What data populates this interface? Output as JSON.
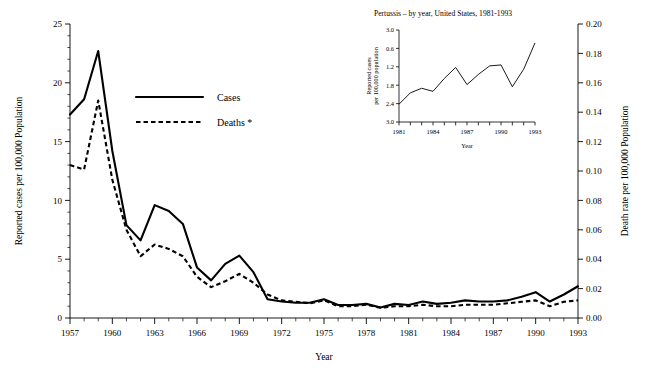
{
  "chart_data": [
    {
      "id": "main",
      "type": "line",
      "title": "",
      "xlabel": "Year",
      "ylabel": "Reported cases per 100,000 Population",
      "y2label": "Death rate per 100,000 Population",
      "xlim": [
        1957,
        1993
      ],
      "ylim": [
        0,
        25
      ],
      "y2lim": [
        0.0,
        0.2
      ],
      "grid": false,
      "legend_position": "upper-center-left",
      "xticks": [
        1957,
        1960,
        1963,
        1966,
        1969,
        1972,
        1975,
        1978,
        1981,
        1984,
        1987,
        1990,
        1993
      ],
      "xticklabels": [
        "1957",
        "1960",
        "1963",
        "1966",
        "1969",
        "1972",
        "1975",
        "1978",
        "1981",
        "1984",
        "1987",
        "1990",
        "1993"
      ],
      "yticks": [
        0,
        5,
        10,
        15,
        20,
        25
      ],
      "yticklabels": [
        "0",
        "5",
        "10",
        "15",
        "20",
        "25"
      ],
      "y2ticks": [
        0.0,
        0.02,
        0.04,
        0.06,
        0.08,
        0.1,
        0.12,
        0.14,
        0.16,
        0.18,
        0.2
      ],
      "y2ticklabels": [
        "0.00",
        "0.02",
        "0.04",
        "0.06",
        "0.08",
        "0.10",
        "0.12",
        "0.14",
        "0.16",
        "0.18",
        "0.20"
      ],
      "x": [
        1957,
        1958,
        1959,
        1960,
        1961,
        1962,
        1963,
        1964,
        1965,
        1966,
        1967,
        1968,
        1969,
        1970,
        1971,
        1972,
        1973,
        1974,
        1975,
        1976,
        1977,
        1978,
        1979,
        1980,
        1981,
        1982,
        1983,
        1984,
        1985,
        1986,
        1987,
        1988,
        1989,
        1990,
        1991,
        1992,
        1993
      ],
      "series": [
        {
          "name": "Cases",
          "axis": "left",
          "style": "solid",
          "values": [
            17.3,
            18.6,
            22.7,
            14.2,
            7.9,
            6.6,
            9.6,
            9.1,
            8.0,
            4.3,
            3.2,
            4.6,
            5.3,
            3.9,
            1.6,
            1.4,
            1.3,
            1.3,
            1.6,
            1.1,
            1.1,
            1.2,
            0.9,
            1.2,
            1.1,
            1.4,
            1.2,
            1.3,
            1.5,
            1.4,
            1.4,
            1.5,
            1.8,
            2.2,
            1.4,
            2.0,
            2.7
          ]
        },
        {
          "name": "Deaths *",
          "axis": "right",
          "style": "dashed",
          "values": [
            0.104,
            0.101,
            0.148,
            0.094,
            0.06,
            0.042,
            0.05,
            0.047,
            0.042,
            0.028,
            0.021,
            0.025,
            0.03,
            0.024,
            0.016,
            0.012,
            0.011,
            0.01,
            0.012,
            0.008,
            0.008,
            0.009,
            0.007,
            0.008,
            0.008,
            0.009,
            0.008,
            0.008,
            0.009,
            0.009,
            0.009,
            0.01,
            0.011,
            0.012,
            0.008,
            0.011,
            0.012
          ]
        }
      ]
    },
    {
      "id": "inset",
      "type": "line",
      "title": "Pertussis – by year, United States, 1981-1993",
      "xlabel": "Year",
      "ylabel_line1": "Reported cases",
      "ylabel_line2": "per 100,000 population",
      "xlim": [
        1981,
        1993
      ],
      "ylim": [
        0.0,
        3.0
      ],
      "grid": false,
      "xticks": [
        1981,
        1982,
        1983,
        1984,
        1985,
        1986,
        1987,
        1988,
        1989,
        1990,
        1991,
        1992,
        1993
      ],
      "xticklabels_shown": [
        "1981",
        "1984",
        "1987",
        "1990",
        "1993"
      ],
      "yticks": [
        0.0,
        0.6,
        1.2,
        1.8,
        2.4,
        3.0
      ],
      "yticklabels": [
        "3.0",
        "2.4",
        "1.8",
        "1.2",
        "0.6",
        "3.0"
      ],
      "x": [
        1981,
        1982,
        1983,
        1984,
        1985,
        1986,
        1987,
        1988,
        1989,
        1990,
        1991,
        1992,
        1993
      ],
      "values": [
        0.58,
        0.95,
        1.1,
        1.0,
        1.42,
        1.78,
        1.22,
        1.55,
        1.83,
        1.86,
        1.15,
        1.72,
        2.58
      ]
    }
  ],
  "main": {
    "ylabel": "Reported cases per 100,000 Population",
    "y2label": "Death rate per 100,000 Population",
    "xlabel": "Year",
    "legend": {
      "cases": "Cases",
      "deaths": "Deaths *"
    }
  },
  "inset": {
    "title": "Pertussis – by year, United States, 1981-1993",
    "ylabel_line1": "Reported cases",
    "ylabel_line2": "per 100,000 population",
    "xlabel": "Year"
  },
  "colors": {
    "ink": "#000000",
    "background": "#ffffff"
  }
}
